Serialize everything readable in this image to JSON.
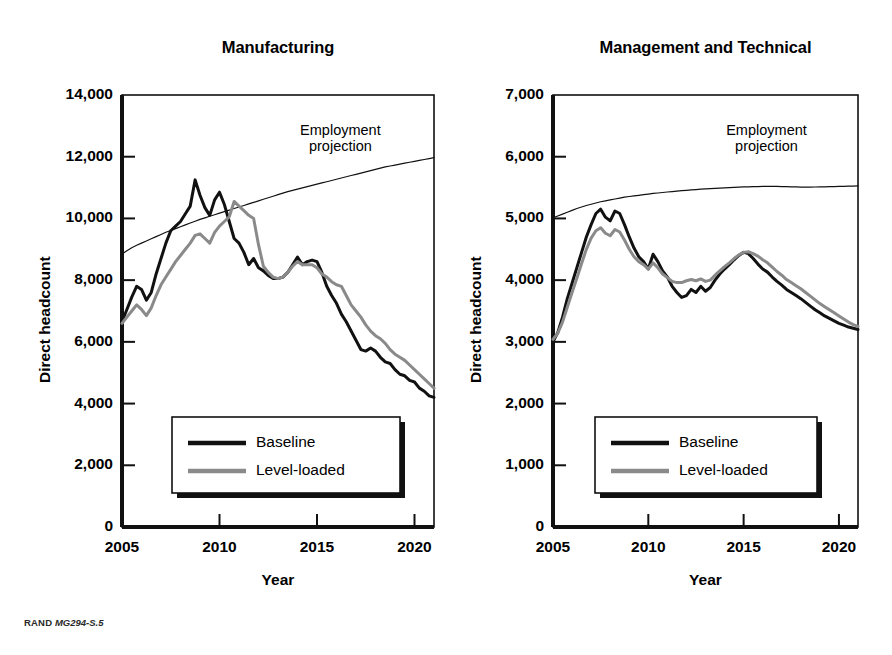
{
  "figure": {
    "footer_brand": "RAND",
    "footer_code": "MG294-S.5",
    "background_color": "#ffffff"
  },
  "colors": {
    "baseline": "#111111",
    "level_loaded": "#8a8a8a",
    "projection": "#111111",
    "axis": "#111111",
    "legend_border": "#111111",
    "legend_shadow": "#111111"
  },
  "panels": [
    {
      "id": "manufacturing",
      "title": "Manufacturing",
      "xlabel": "Year",
      "ylabel": "Direct headcount",
      "annotation": "Employment\nprojection",
      "legend": {
        "items": [
          {
            "label": "Baseline",
            "color_key": "baseline"
          },
          {
            "label": "Level-loaded",
            "color_key": "level_loaded"
          }
        ]
      },
      "y_ticks": [
        "0",
        "2,000",
        "4,000",
        "6,000",
        "8,000",
        "10,000",
        "12,000",
        "14,000"
      ],
      "x_ticks": [
        "2005",
        "2010",
        "2015",
        "2020"
      ]
    },
    {
      "id": "management-and-technical",
      "title": "Management and Technical",
      "xlabel": "Year",
      "ylabel": "Direct headcount",
      "annotation": "Employment\nprojection",
      "legend": {
        "items": [
          {
            "label": "Baseline",
            "color_key": "baseline"
          },
          {
            "label": "Level-loaded",
            "color_key": "level_loaded"
          }
        ]
      },
      "y_ticks": [
        "0",
        "1,000",
        "2,000",
        "3,000",
        "4,000",
        "5,000",
        "6,000",
        "7,000"
      ],
      "x_ticks": [
        "2005",
        "2010",
        "2015",
        "2020"
      ]
    }
  ],
  "chart_data": [
    {
      "type": "line",
      "title": "Manufacturing",
      "xlabel": "Year",
      "ylabel": "Direct headcount",
      "xlim": [
        2005,
        2021
      ],
      "ylim": [
        0,
        14000
      ],
      "ytick_values": [
        0,
        2000,
        4000,
        6000,
        8000,
        10000,
        12000,
        14000
      ],
      "xtick_values": [
        2005,
        2010,
        2015,
        2020
      ],
      "grid": false,
      "legend_position": "lower-center",
      "annotations": [
        {
          "text": "Employment projection",
          "x": 2016.2,
          "y": 12600
        }
      ],
      "x": [
        2005.0,
        2005.25,
        2005.5,
        2005.75,
        2006.0,
        2006.25,
        2006.5,
        2006.75,
        2007.0,
        2007.25,
        2007.5,
        2007.75,
        2008.0,
        2008.25,
        2008.5,
        2008.75,
        2009.0,
        2009.25,
        2009.5,
        2009.75,
        2010.0,
        2010.25,
        2010.5,
        2010.75,
        2011.0,
        2011.25,
        2011.5,
        2011.75,
        2012.0,
        2012.25,
        2012.5,
        2012.75,
        2013.0,
        2013.25,
        2013.5,
        2013.75,
        2014.0,
        2014.25,
        2014.5,
        2014.75,
        2015.0,
        2015.25,
        2015.5,
        2015.75,
        2016.0,
        2016.25,
        2016.5,
        2016.75,
        2017.0,
        2017.25,
        2017.5,
        2017.75,
        2018.0,
        2018.25,
        2018.5,
        2018.75,
        2019.0,
        2019.25,
        2019.5,
        2019.75,
        2020.0,
        2020.25,
        2020.5,
        2020.75,
        2021.0
      ],
      "series": [
        {
          "name": "Baseline",
          "color_key": "baseline",
          "values": [
            6650,
            7050,
            7450,
            7800,
            7700,
            7350,
            7600,
            8200,
            8700,
            9200,
            9600,
            9750,
            9900,
            10150,
            10400,
            11250,
            10750,
            10350,
            10100,
            10600,
            10850,
            10450,
            9900,
            9350,
            9200,
            8900,
            8500,
            8700,
            8400,
            8300,
            8150,
            8050,
            8050,
            8100,
            8250,
            8500,
            8750,
            8500,
            8600,
            8650,
            8600,
            8250,
            7800,
            7500,
            7250,
            6900,
            6650,
            6350,
            6050,
            5750,
            5700,
            5800,
            5700,
            5500,
            5350,
            5300,
            5100,
            4950,
            4900,
            4750,
            4700,
            4500,
            4400,
            4250,
            4200
          ]
        },
        {
          "name": "Level-loaded",
          "color_key": "level_loaded",
          "values": [
            6600,
            6800,
            7000,
            7200,
            7050,
            6850,
            7100,
            7500,
            7850,
            8100,
            8350,
            8600,
            8800,
            9000,
            9200,
            9450,
            9500,
            9350,
            9200,
            9550,
            9750,
            9900,
            10050,
            10550,
            10400,
            10250,
            10100,
            10000,
            9150,
            8450,
            8250,
            8100,
            8050,
            8100,
            8250,
            8450,
            8600,
            8500,
            8500,
            8500,
            8400,
            8200,
            8100,
            7950,
            7850,
            7800,
            7500,
            7200,
            7000,
            6800,
            6550,
            6350,
            6200,
            6100,
            5950,
            5750,
            5600,
            5500,
            5400,
            5250,
            5100,
            4950,
            4800,
            4650,
            4500
          ]
        },
        {
          "name": "Employment projection",
          "color_key": "projection",
          "thin": true,
          "values": [
            8850,
            8950,
            9050,
            9130,
            9200,
            9270,
            9340,
            9410,
            9480,
            9550,
            9610,
            9670,
            9730,
            9790,
            9850,
            9910,
            9970,
            10020,
            10070,
            10120,
            10170,
            10220,
            10270,
            10320,
            10370,
            10420,
            10470,
            10520,
            10570,
            10620,
            10670,
            10720,
            10770,
            10820,
            10870,
            10910,
            10950,
            10990,
            11030,
            11070,
            11110,
            11150,
            11190,
            11230,
            11270,
            11310,
            11350,
            11390,
            11430,
            11470,
            11510,
            11550,
            11590,
            11630,
            11670,
            11700,
            11730,
            11760,
            11790,
            11820,
            11850,
            11880,
            11910,
            11940,
            11970
          ]
        }
      ]
    },
    {
      "type": "line",
      "title": "Management and Technical",
      "xlabel": "Year",
      "ylabel": "Direct headcount",
      "xlim": [
        2005,
        2021
      ],
      "ylim": [
        0,
        7000
      ],
      "ytick_values": [
        0,
        1000,
        2000,
        3000,
        4000,
        5000,
        6000,
        7000
      ],
      "xtick_values": [
        2005,
        2010,
        2015,
        2020
      ],
      "grid": false,
      "legend_position": "lower-center",
      "annotations": [
        {
          "text": "Employment projection",
          "x": 2016.2,
          "y": 6300
        }
      ],
      "x": [
        2005.0,
        2005.25,
        2005.5,
        2005.75,
        2006.0,
        2006.25,
        2006.5,
        2006.75,
        2007.0,
        2007.25,
        2007.5,
        2007.75,
        2008.0,
        2008.25,
        2008.5,
        2008.75,
        2009.0,
        2009.25,
        2009.5,
        2009.75,
        2010.0,
        2010.25,
        2010.5,
        2010.75,
        2011.0,
        2011.25,
        2011.5,
        2011.75,
        2012.0,
        2012.25,
        2012.5,
        2012.75,
        2013.0,
        2013.25,
        2013.5,
        2013.75,
        2014.0,
        2014.25,
        2014.5,
        2014.75,
        2015.0,
        2015.25,
        2015.5,
        2015.75,
        2016.0,
        2016.25,
        2016.5,
        2016.75,
        2017.0,
        2017.25,
        2017.5,
        2017.75,
        2018.0,
        2018.25,
        2018.5,
        2018.75,
        2019.0,
        2019.25,
        2019.5,
        2019.75,
        2020.0,
        2020.25,
        2020.5,
        2020.75,
        2021.0
      ],
      "series": [
        {
          "name": "Baseline",
          "color_key": "baseline",
          "values": [
            3000,
            3150,
            3400,
            3700,
            3950,
            4200,
            4450,
            4700,
            4900,
            5080,
            5150,
            5020,
            4960,
            5120,
            5080,
            4900,
            4700,
            4520,
            4380,
            4300,
            4180,
            4420,
            4300,
            4150,
            4050,
            3900,
            3800,
            3720,
            3750,
            3850,
            3800,
            3900,
            3820,
            3880,
            4000,
            4100,
            4180,
            4250,
            4330,
            4400,
            4450,
            4430,
            4350,
            4260,
            4180,
            4130,
            4050,
            3980,
            3920,
            3850,
            3800,
            3750,
            3700,
            3640,
            3580,
            3520,
            3470,
            3420,
            3380,
            3340,
            3300,
            3270,
            3240,
            3220,
            3200
          ]
        },
        {
          "name": "Level-loaded",
          "color_key": "level_loaded",
          "values": [
            3040,
            3140,
            3320,
            3560,
            3800,
            4030,
            4270,
            4500,
            4680,
            4800,
            4850,
            4760,
            4720,
            4820,
            4780,
            4650,
            4500,
            4380,
            4300,
            4250,
            4180,
            4280,
            4200,
            4100,
            4040,
            3980,
            3960,
            3960,
            3990,
            4010,
            3990,
            4020,
            3980,
            4000,
            4080,
            4150,
            4220,
            4280,
            4350,
            4410,
            4450,
            4460,
            4430,
            4390,
            4330,
            4280,
            4210,
            4140,
            4080,
            4010,
            3960,
            3910,
            3860,
            3800,
            3740,
            3680,
            3620,
            3570,
            3520,
            3470,
            3420,
            3370,
            3320,
            3280,
            3250
          ]
        },
        {
          "name": "Employment projection",
          "color_key": "projection",
          "thin": true,
          "values": [
            5010,
            5040,
            5070,
            5100,
            5130,
            5160,
            5185,
            5210,
            5230,
            5250,
            5270,
            5285,
            5300,
            5315,
            5330,
            5345,
            5355,
            5365,
            5375,
            5385,
            5395,
            5405,
            5412,
            5420,
            5428,
            5435,
            5442,
            5450,
            5456,
            5462,
            5468,
            5474,
            5480,
            5484,
            5488,
            5492,
            5496,
            5500,
            5504,
            5508,
            5510,
            5512,
            5514,
            5516,
            5518,
            5520,
            5520,
            5518,
            5516,
            5514,
            5512,
            5510,
            5508,
            5508,
            5508,
            5509,
            5510,
            5512,
            5514,
            5516,
            5518,
            5520,
            5522,
            5524,
            5526
          ]
        }
      ]
    }
  ]
}
